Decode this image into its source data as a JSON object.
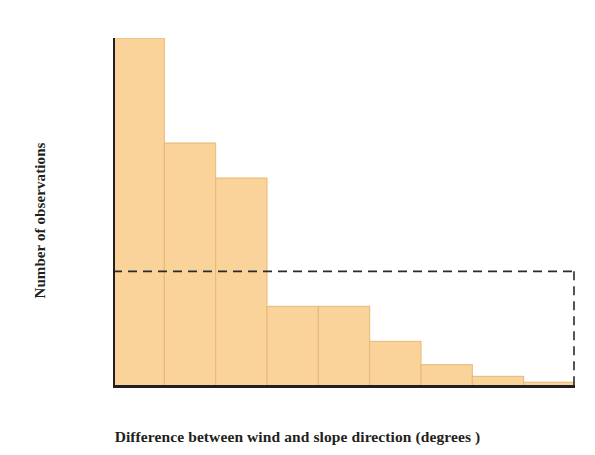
{
  "chart_data": {
    "type": "bar",
    "title": "",
    "subtitle": "",
    "xlabel": "Difference between wind and slope direction (degrees )",
    "ylabel": "Number of observations",
    "categories": [
      "0",
      "20",
      "40",
      "60",
      "80",
      "100",
      "120",
      "140",
      "160"
    ],
    "bin_starts": [
      -10,
      10,
      30,
      50,
      70,
      90,
      110,
      130,
      150
    ],
    "bin_ends": [
      10,
      30,
      50,
      70,
      90,
      110,
      130,
      150,
      170
    ],
    "values": [
      30,
      21,
      18,
      7,
      7,
      4,
      2,
      1,
      0.5
    ],
    "xtick_labels": [
      "0",
      "20",
      "40",
      "60",
      "80",
      "100",
      "120",
      "140",
      "160"
    ],
    "xtick_values": [
      0,
      20,
      40,
      60,
      80,
      100,
      120,
      140,
      160
    ],
    "ytick_labels": [
      "10",
      "20",
      "30"
    ],
    "ytick_values": [
      10,
      20,
      30
    ],
    "xlim": [
      -10,
      170
    ],
    "ylim": [
      0,
      30
    ],
    "grid": false,
    "legend": null,
    "annotations": [
      {
        "name": "reference-line",
        "type": "dashed-threshold",
        "y_value": 10,
        "x_from": -10,
        "x_to": 170,
        "drops_to_axis": true
      }
    ],
    "colors": {
      "bar_fill": "#FAD39A",
      "bar_stroke": "#E8B877",
      "axis": "#231f20",
      "text": "#231f20",
      "dashed_line": "#2b2b2b",
      "background": "#ffffff"
    }
  }
}
